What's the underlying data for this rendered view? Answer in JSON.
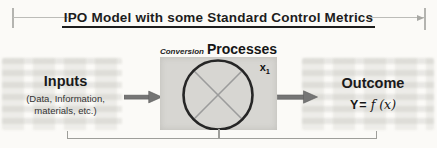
{
  "title": {
    "text": "IPO Model with some Standard Control Metrics"
  },
  "process": {
    "label_conversion": "Conversion",
    "label_processes": "Processes",
    "variable_base": "x",
    "variable_subscript": "1"
  },
  "inputs": {
    "heading": "Inputs",
    "description_line1": "(Data, Information,",
    "description_line2": "materials, etc.)"
  },
  "outcome": {
    "heading": "Outcome",
    "formula_y": "Y",
    "formula_equals": "=",
    "formula_fx": "f (x)"
  },
  "icons": {
    "input_arrow": "right-arrow-icon",
    "output_arrow": "right-arrow-icon",
    "process_symbol": "crossed-circle-icon"
  },
  "colors": {
    "background": "#fbfaf7",
    "process_box_fill": "#d7d6d2",
    "circle_stroke": "#262626",
    "cross_stroke": "#9c9c9c",
    "arrow_fill": "#757575",
    "dimension_line": "#bcbcb8",
    "bracket_line": "#9e9e9a",
    "title_text": "#1d1d1d"
  }
}
